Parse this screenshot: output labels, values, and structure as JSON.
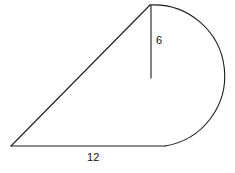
{
  "figure": {
    "background_color": "#ffffff",
    "stroke_color": "#1c1c1c",
    "labels": {
      "height": "6",
      "base": "12"
    },
    "geometry": {
      "apex_point": [
        150,
        5
      ],
      "left_vertex": [
        11,
        146
      ],
      "arc_base_point": [
        165,
        146
      ],
      "arc_rightmost": [
        216,
        78
      ],
      "vertical_line": {
        "x": 151,
        "y_top": 5,
        "y_bottom": 78
      },
      "base_line": {
        "y": 146,
        "x_start": 11,
        "x_end": 165
      }
    },
    "paths": {
      "hypotenuse": "M 11 146 L 150 5",
      "base": "M 11 146 L 165 146",
      "arc": "M 150 5 A 71 71 0 0 1 165 146",
      "height_tick": "M 151 5 L 151 78"
    }
  }
}
